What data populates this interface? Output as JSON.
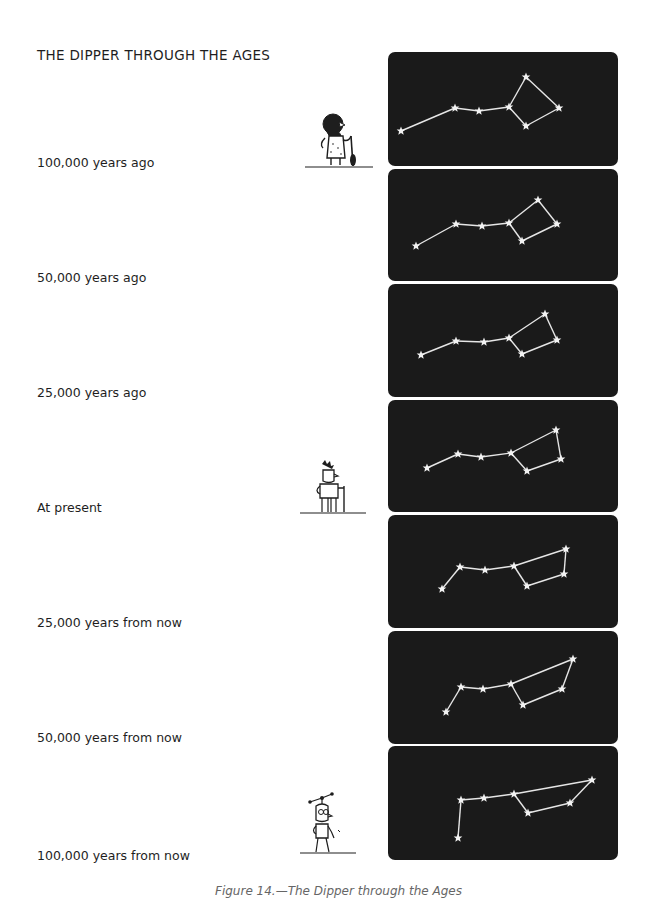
{
  "page": {
    "title": "THE DIPPER THROUGH THE AGES",
    "caption": "Figure 14.—The Dipper through the Ages"
  },
  "eras": [
    {
      "label": "100,000 years ago",
      "label_y": 155,
      "panel_top": 52,
      "panel_height": 114
    },
    {
      "label": "50,000 years ago",
      "label_y": 270,
      "panel_top": 169,
      "panel_height": 112
    },
    {
      "label": "25,000 years ago",
      "label_y": 385,
      "panel_top": 284,
      "panel_height": 113
    },
    {
      "label": "At present",
      "label_y": 500,
      "panel_top": 400,
      "panel_height": 112
    },
    {
      "label": "25,000 years from now",
      "label_y": 615,
      "panel_top": 515,
      "panel_height": 113
    },
    {
      "label": "50,000 years from now",
      "label_y": 730,
      "panel_top": 631,
      "panel_height": 113
    },
    {
      "label": "100,000 years from now",
      "label_y": 848,
      "panel_top": 746,
      "panel_height": 114
    }
  ],
  "figures": [
    {
      "name": "caveman",
      "x": 303,
      "y": 108
    },
    {
      "name": "present-man",
      "x": 300,
      "y": 458
    },
    {
      "name": "future-man",
      "x": 298,
      "y": 792
    }
  ],
  "colors": {
    "panel_bg": "#1a1a1a",
    "star": "#f2f2f2",
    "line": "#e6e6e6",
    "text": "#1e1e1e"
  },
  "chart_data": {
    "type": "diagram",
    "title": "THE DIPPER THROUGH THE AGES",
    "stars_order": [
      "Alkaid",
      "Mizar",
      "Alioth",
      "Megrez",
      "Dubhe",
      "Merak",
      "Phecda"
    ],
    "edges": [
      [
        0,
        1
      ],
      [
        1,
        2
      ],
      [
        2,
        3
      ],
      [
        3,
        4
      ],
      [
        4,
        5
      ],
      [
        5,
        6
      ],
      [
        6,
        3
      ]
    ],
    "series": [
      {
        "name": "100,000 years ago",
        "points": [
          [
            401,
            131
          ],
          [
            455,
            108
          ],
          [
            479,
            111
          ],
          [
            509,
            107
          ],
          [
            526,
            77
          ],
          [
            559,
            108
          ],
          [
            526,
            126
          ]
        ]
      },
      {
        "name": "50,000 years ago",
        "points": [
          [
            416,
            246
          ],
          [
            456,
            224
          ],
          [
            482,
            226
          ],
          [
            509,
            223
          ],
          [
            538,
            200
          ],
          [
            557,
            224
          ],
          [
            522,
            241
          ]
        ]
      },
      {
        "name": "25,000 years ago",
        "points": [
          [
            421,
            355
          ],
          [
            456,
            341
          ],
          [
            484,
            342
          ],
          [
            509,
            338
          ],
          [
            545,
            314
          ],
          [
            557,
            340
          ],
          [
            522,
            354
          ]
        ]
      },
      {
        "name": "At present",
        "points": [
          [
            427,
            468
          ],
          [
            458,
            454
          ],
          [
            481,
            457
          ],
          [
            511,
            453
          ],
          [
            556,
            430
          ],
          [
            561,
            459
          ],
          [
            527,
            471
          ]
        ]
      },
      {
        "name": "25,000 years from now",
        "points": [
          [
            442,
            589
          ],
          [
            460,
            567
          ],
          [
            485,
            570
          ],
          [
            514,
            566
          ],
          [
            566,
            549
          ],
          [
            564,
            574
          ],
          [
            527,
            586
          ]
        ]
      },
      {
        "name": "50,000 years from now",
        "points": [
          [
            446,
            712
          ],
          [
            461,
            687
          ],
          [
            483,
            689
          ],
          [
            511,
            684
          ],
          [
            573,
            659
          ],
          [
            562,
            689
          ],
          [
            523,
            705
          ]
        ]
      },
      {
        "name": "100,000 years from now",
        "points": [
          [
            458,
            838
          ],
          [
            461,
            800
          ],
          [
            484,
            798
          ],
          [
            514,
            794
          ],
          [
            592,
            780
          ],
          [
            570,
            803
          ],
          [
            528,
            813
          ]
        ]
      }
    ]
  }
}
